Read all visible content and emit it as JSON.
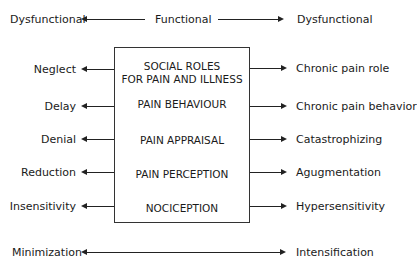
{
  "top_row": {
    "left_label": "Dysfunctional",
    "center_label": "Functional",
    "right_label": "Dysfunctional"
  },
  "box": {
    "levels": [
      {
        "line1": "SOCIAL ROLES",
        "line2": "FOR PAIN AND ILLNESS"
      },
      {
        "line1": "PAIN BEHAVIOUR"
      },
      {
        "line1": "PAIN APPRAISAL"
      },
      {
        "line1": "PAIN PERCEPTION"
      },
      {
        "line1": "NOCICEPTION"
      }
    ]
  },
  "left_outcomes": [
    "Neglect",
    "Delay",
    "Denial",
    "Reduction",
    "Insensitivity"
  ],
  "right_outcomes": [
    "Chronic pain role",
    "Chronic pain behavior",
    "Catastrophizing",
    "Agugmentation",
    "Hypersensitivity"
  ],
  "bottom_row": {
    "left_label": "Minimization",
    "right_label": "Intensification"
  }
}
